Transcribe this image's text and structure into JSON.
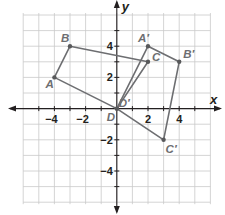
{
  "axes": {
    "x_label": "x",
    "y_label": "y",
    "x_range": [
      -6,
      6
    ],
    "y_range": [
      -6,
      6
    ],
    "x_tick_labels": [
      {
        "value": -4,
        "text": "−4"
      },
      {
        "value": -2,
        "text": "−2"
      },
      {
        "value": 2,
        "text": "2"
      },
      {
        "value": 4,
        "text": "4"
      }
    ],
    "y_tick_labels": [
      {
        "value": 4,
        "text": "4"
      },
      {
        "value": 2,
        "text": "2"
      },
      {
        "value": -2,
        "text": "−2"
      },
      {
        "value": -4,
        "text": "−4"
      }
    ],
    "grid": true
  },
  "figures": [
    {
      "name": "ABCD",
      "color": "#6d6e71",
      "vertices": [
        {
          "label": "A",
          "x": -4,
          "y": 2
        },
        {
          "label": "B",
          "x": -3,
          "y": 4
        },
        {
          "label": "C",
          "x": 2,
          "y": 3
        },
        {
          "label": "D",
          "x": 0,
          "y": 0
        }
      ]
    },
    {
      "name": "A'B'C'D'",
      "color": "#6d6e71",
      "vertices": [
        {
          "label": "A′",
          "x": 2,
          "y": 4
        },
        {
          "label": "B′",
          "x": 4,
          "y": 3
        },
        {
          "label": "C′",
          "x": 3,
          "y": -2
        },
        {
          "label": "D′",
          "x": 0,
          "y": 0
        }
      ]
    }
  ],
  "colors": {
    "grid": "#c9c9c9",
    "axis": "#231f20",
    "figure": "#6d6e71"
  }
}
